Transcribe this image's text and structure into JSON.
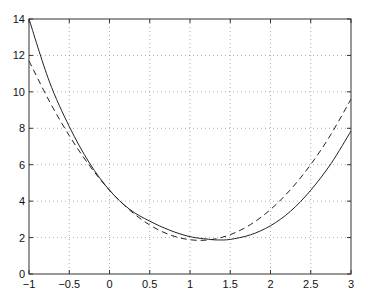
{
  "chart_data": {
    "type": "line",
    "title": "",
    "xlabel": "",
    "ylabel": "",
    "xlim": [
      -1,
      3
    ],
    "ylim": [
      0,
      14
    ],
    "grid": true,
    "x_ticks": [
      "-1",
      "-0.5",
      "0",
      "0.5",
      "1",
      "1.5",
      "2",
      "2.5",
      "3"
    ],
    "y_ticks": [
      "0",
      "2",
      "4",
      "6",
      "8",
      "10",
      "12",
      "14"
    ],
    "series": [
      {
        "name": "function (solid)",
        "style": "solid",
        "x": [
          -1,
          -0.75,
          -0.5,
          -0.25,
          0,
          0.25,
          0.5,
          0.75,
          1,
          1.25,
          1.35,
          1.5,
          1.75,
          2,
          2.25,
          2.5,
          2.75,
          3
        ],
        "values": [
          14.0,
          10.6,
          8.1,
          6.1,
          4.6,
          3.55,
          2.9,
          2.4,
          2.05,
          1.9,
          1.87,
          1.9,
          2.15,
          2.65,
          3.45,
          4.6,
          6.05,
          7.85
        ]
      },
      {
        "name": "quadratic approximation (dashed)",
        "style": "dashed",
        "x": [
          -1,
          -0.75,
          -0.5,
          -0.25,
          0,
          0.25,
          0.5,
          0.75,
          1,
          1.25,
          1.5,
          1.75,
          2,
          2.25,
          2.5,
          2.75,
          3
        ],
        "values": [
          11.7,
          9.51,
          7.6,
          5.96,
          4.6,
          3.51,
          2.69,
          2.15,
          1.88,
          1.88,
          2.16,
          2.71,
          3.54,
          4.64,
          6.01,
          7.66,
          9.6
        ]
      }
    ]
  }
}
